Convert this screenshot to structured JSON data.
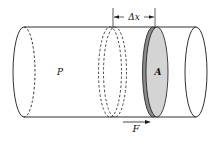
{
  "diagram": {
    "type": "physics-illustration",
    "labels": {
      "pressure": "P",
      "area": "A",
      "displacement": "Δx",
      "force": "F"
    },
    "colors": {
      "stroke": "#1a1a1a",
      "disk_face": "#d4d4d4",
      "disk_edge": "#8a8a8a",
      "background": "#ffffff"
    }
  }
}
